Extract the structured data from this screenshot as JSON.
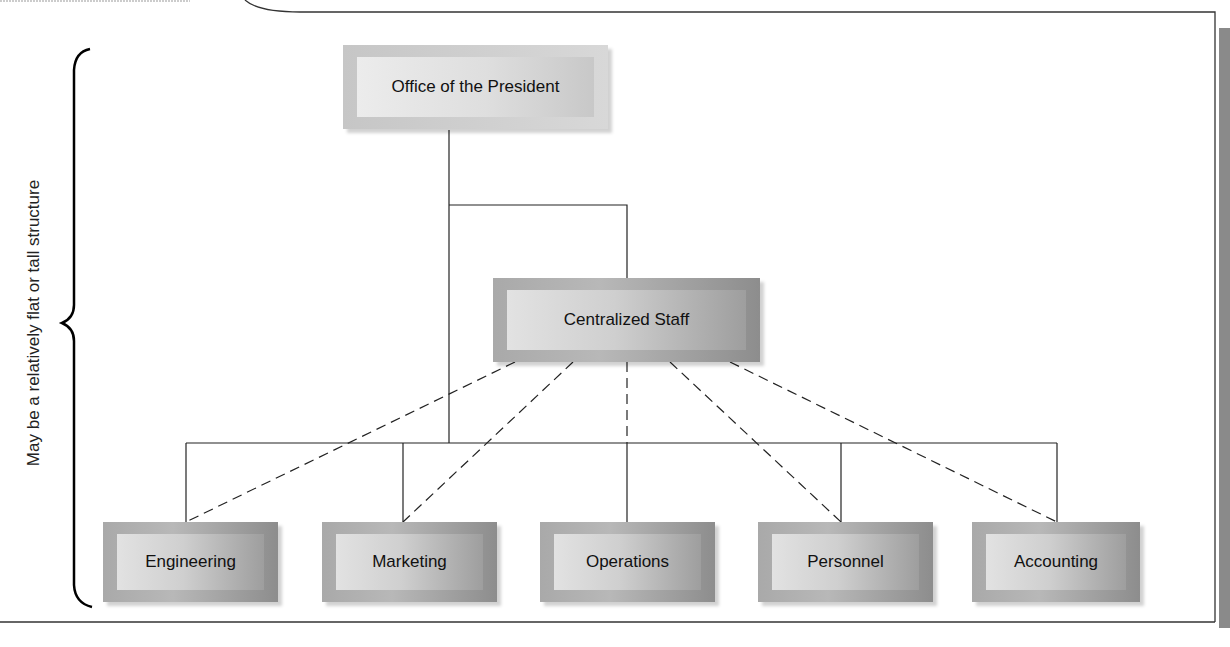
{
  "diagram": {
    "side_label": "May be a relatively flat or tall structure",
    "top": {
      "label": "Office of the President"
    },
    "staff": {
      "label": "Centralized Staff"
    },
    "departments": [
      {
        "label": "Engineering"
      },
      {
        "label": "Marketing"
      },
      {
        "label": "Operations"
      },
      {
        "label": "Personnel"
      },
      {
        "label": "Accounting"
      }
    ],
    "legend": {
      "solid_line": "line authority",
      "dashed_line": "staff relationship"
    }
  }
}
